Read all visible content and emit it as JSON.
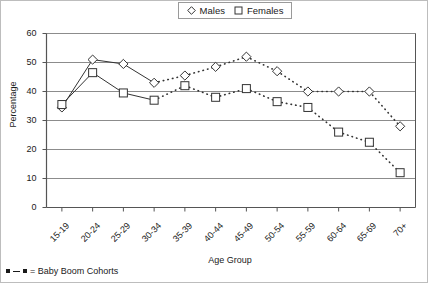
{
  "chart_data": {
    "type": "line",
    "title": "",
    "xlabel": "Age Group",
    "ylabel": "Percentage",
    "ylim": [
      0,
      60
    ],
    "yticks": [
      0,
      10,
      20,
      30,
      40,
      50,
      60
    ],
    "grid": true,
    "legend_position": "top-center",
    "categories": [
      "15-19",
      "20-24",
      "25-29",
      "30-34",
      "35-39",
      "40-44",
      "45-49",
      "50-54",
      "55-59",
      "60-64",
      "65-69",
      "70+"
    ],
    "series": [
      {
        "name": "Males",
        "marker": "diamond",
        "values": [
          34.5,
          51,
          49.5,
          43,
          45.5,
          48.5,
          52,
          47,
          40,
          40,
          40,
          28
        ],
        "dashed_from_index": 3,
        "dashed_to_index": 11
      },
      {
        "name": "Females",
        "marker": "square",
        "values": [
          35.5,
          46.5,
          39.5,
          37,
          42,
          38,
          41,
          36.5,
          34.5,
          26,
          22.5,
          12
        ],
        "dashed_from_index": 3,
        "dashed_to_index": 11
      }
    ],
    "annotations": [
      {
        "text": "= Baby Boom Cohorts",
        "marker": "dashed-dot-line"
      }
    ]
  },
  "legend": {
    "items": [
      {
        "label": "Males",
        "marker": "diamond"
      },
      {
        "label": "Females",
        "marker": "square"
      }
    ]
  },
  "footnote": {
    "text": "= Baby Boom Cohorts"
  },
  "colors": {
    "line": "#333333",
    "grid": "#8c8c8c",
    "axis": "#555555",
    "text": "#1a1a1a",
    "background": "#ffffff"
  }
}
